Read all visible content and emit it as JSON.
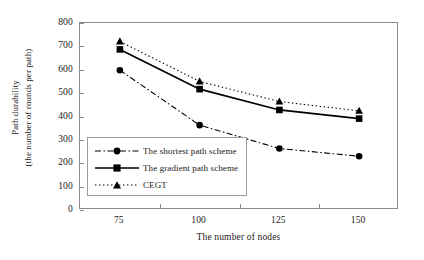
{
  "chart_data": {
    "type": "line",
    "title": "",
    "xlabel": "The number of nodes",
    "ylabel_line1": "Path durability",
    "ylabel_line2": "(the number of rounds per path)",
    "categories": [
      75,
      100,
      125,
      150
    ],
    "x_tick_labels": [
      "75",
      "100",
      "125",
      "150"
    ],
    "y_tick_labels": [
      "800",
      "700",
      "600",
      "500",
      "400",
      "300",
      "200",
      "100",
      "0"
    ],
    "ylim": [
      0,
      800
    ],
    "ytick_step": 100,
    "grid": false,
    "legend_position": "lower-left-inside",
    "series": [
      {
        "name": "The shortest path scheme",
        "marker": "circle",
        "linestyle": "dash-dot",
        "color": "#000000",
        "values": [
          598,
          363,
          263,
          230
        ]
      },
      {
        "name": "The gradient path scheme",
        "marker": "square",
        "linestyle": "solid",
        "color": "#000000",
        "values": [
          687,
          517,
          428,
          391
        ]
      },
      {
        "name": "CEGT",
        "marker": "triangle",
        "linestyle": "dotted",
        "color": "#000000",
        "values": [
          721,
          550,
          464,
          424
        ]
      }
    ]
  },
  "style": {
    "axis_color": "#8c8c8c",
    "legend_border": "#9a9a9a",
    "ink": "#000000",
    "background": "#ffffff"
  }
}
